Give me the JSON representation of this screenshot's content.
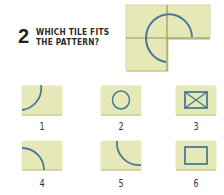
{
  "question": {
    "number": "2",
    "line1": "WHICH TILE FITS",
    "line2": "THE PATTERN?"
  },
  "colors": {
    "tile_fill": "#e6e8b8",
    "tile_shadow": "#c9cb9a",
    "line": "#4a7a92",
    "grout": "#8f9a5a"
  },
  "pattern": {
    "description": "L-shaped group of three tiles with arc segments forming part of a circle; bottom-right tile missing"
  },
  "options": [
    {
      "label": "1",
      "shape": "arc-top-right-to-bottom-left"
    },
    {
      "label": "2",
      "shape": "circle"
    },
    {
      "label": "3",
      "shape": "rectangle-with-cross"
    },
    {
      "label": "4",
      "shape": "arc-quarter-top-left"
    },
    {
      "label": "5",
      "shape": "arc-quarter-bottom-left"
    },
    {
      "label": "6",
      "shape": "rectangle"
    }
  ]
}
